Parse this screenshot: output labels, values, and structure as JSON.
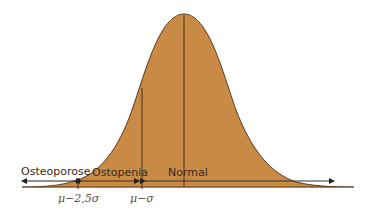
{
  "diagram": {
    "type": "normal-distribution-bone-density",
    "colors": {
      "fill": "#c98a45",
      "outline": "#5a3a1e",
      "line": "#4a2e14",
      "axis": "#888888",
      "arrow": "#222222"
    },
    "regions": [
      {
        "label": "Osteoporose"
      },
      {
        "label": "Ostopenia"
      },
      {
        "label": "Normal"
      }
    ],
    "ticks": [
      {
        "label": "μ−2,5σ"
      },
      {
        "label": "μ−σ"
      }
    ]
  }
}
